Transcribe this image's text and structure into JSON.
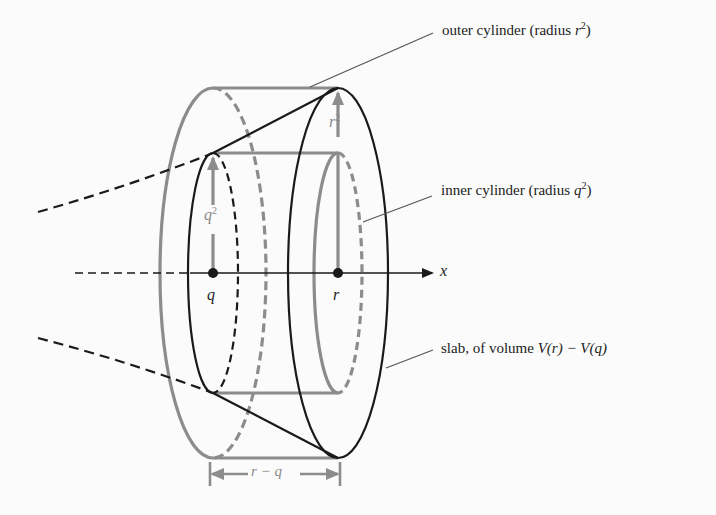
{
  "figure": {
    "type": "solid-of-revolution diagram",
    "axis_label": "x",
    "points": [
      {
        "name": "q",
        "label": "q"
      },
      {
        "name": "r",
        "label": "r"
      }
    ],
    "radii": {
      "q_label_base": "q",
      "q_label_exp": "2",
      "r_label_base": "r",
      "r_label_exp": "2"
    },
    "width_label": "r − q",
    "colors": {
      "black": "#1a1a1a",
      "gray": "#8c8c8c",
      "background": "#fbfbfb"
    }
  },
  "annotations": {
    "outer": {
      "text": "outer cylinder (radius ",
      "var": "r",
      "exp": "2",
      "close": ")"
    },
    "inner": {
      "text": "inner cylinder (radius ",
      "var": "q",
      "exp": "2",
      "close": ")"
    },
    "slab": {
      "text": "slab, of volume ",
      "formula": "V(r) − V(q)"
    }
  }
}
